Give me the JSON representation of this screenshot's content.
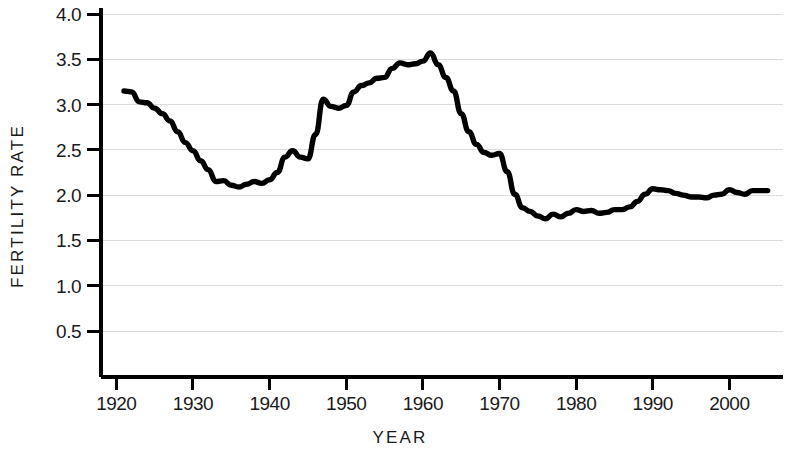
{
  "chart_data": {
    "type": "line",
    "title": "",
    "xlabel": "YEAR",
    "ylabel": "FERTILITY RATE",
    "xlim": [
      1918,
      2007
    ],
    "ylim": [
      0.0,
      4.15
    ],
    "grid": true,
    "legend": false,
    "line_color": "#000000",
    "grid_color": "#dcdcdc",
    "axis_color": "#000000",
    "background_color": "#ffffff",
    "y_ticks": [
      "0.5",
      "1.0",
      "1.5",
      "2.0",
      "2.5",
      "3.0",
      "3.5",
      "4.0"
    ],
    "y_tick_values": [
      0.5,
      1.0,
      1.5,
      2.0,
      2.5,
      3.0,
      3.5,
      4.0
    ],
    "x_ticks": [
      "1920",
      "1930",
      "1940",
      "1950",
      "1960",
      "1970",
      "1980",
      "1990",
      "2000"
    ],
    "x_tick_values": [
      1920,
      1930,
      1940,
      1950,
      1960,
      1970,
      1980,
      1990,
      2000
    ],
    "series": [
      {
        "name": "Fertility Rate",
        "x": [
          1921,
          1922,
          1923,
          1924,
          1925,
          1926,
          1927,
          1928,
          1929,
          1930,
          1931,
          1932,
          1933,
          1934,
          1935,
          1936,
          1937,
          1938,
          1939,
          1940,
          1941,
          1942,
          1943,
          1944,
          1945,
          1946,
          1947,
          1948,
          1949,
          1950,
          1951,
          1952,
          1953,
          1954,
          1955,
          1956,
          1957,
          1958,
          1959,
          1960,
          1961,
          1962,
          1963,
          1964,
          1965,
          1966,
          1967,
          1968,
          1969,
          1970,
          1971,
          1972,
          1973,
          1974,
          1975,
          1976,
          1977,
          1978,
          1979,
          1980,
          1981,
          1982,
          1983,
          1984,
          1985,
          1986,
          1987,
          1988,
          1989,
          1990,
          1991,
          1992,
          1993,
          1994,
          1995,
          1996,
          1997,
          1998,
          1999,
          2000,
          2001,
          2002,
          2003,
          2004,
          2005
        ],
        "values": [
          3.15,
          3.14,
          3.03,
          3.02,
          2.96,
          2.9,
          2.82,
          2.7,
          2.58,
          2.49,
          2.38,
          2.28,
          2.15,
          2.16,
          2.11,
          2.09,
          2.12,
          2.15,
          2.13,
          2.17,
          2.25,
          2.42,
          2.49,
          2.42,
          2.4,
          2.67,
          3.06,
          2.98,
          2.96,
          2.99,
          3.14,
          3.21,
          3.24,
          3.29,
          3.3,
          3.4,
          3.46,
          3.44,
          3.45,
          3.48,
          3.57,
          3.44,
          3.3,
          3.15,
          2.9,
          2.7,
          2.56,
          2.47,
          2.44,
          2.46,
          2.26,
          2.01,
          1.86,
          1.82,
          1.77,
          1.74,
          1.79,
          1.76,
          1.8,
          1.84,
          1.82,
          1.83,
          1.8,
          1.81,
          1.84,
          1.84,
          1.87,
          1.93,
          2.01,
          2.07,
          2.06,
          2.05,
          2.02,
          2.0,
          1.98,
          1.98,
          1.97,
          2.0,
          2.01,
          2.06,
          2.03,
          2.01,
          2.05,
          2.05,
          2.05
        ]
      }
    ]
  },
  "axis_titles": {
    "x": "YEAR",
    "y": "FERTILITY RATE"
  }
}
